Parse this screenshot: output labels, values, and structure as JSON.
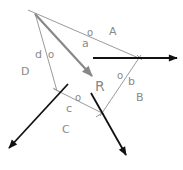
{
  "diagram": {
    "title": "",
    "colors": {
      "polygon_line": "#9a9a9a",
      "resultant": "#888888",
      "force": "#111111",
      "label": "#8a8a8a"
    },
    "region_labels": {
      "A": "A",
      "B": "B",
      "C": "C",
      "D": "D"
    },
    "side_labels": {
      "a": "a",
      "b": "b",
      "c": "c",
      "d": "d"
    },
    "origin_marks": {
      "a": "o",
      "b": "o",
      "c": "o",
      "d": "o"
    },
    "resultant_label": "R"
  }
}
